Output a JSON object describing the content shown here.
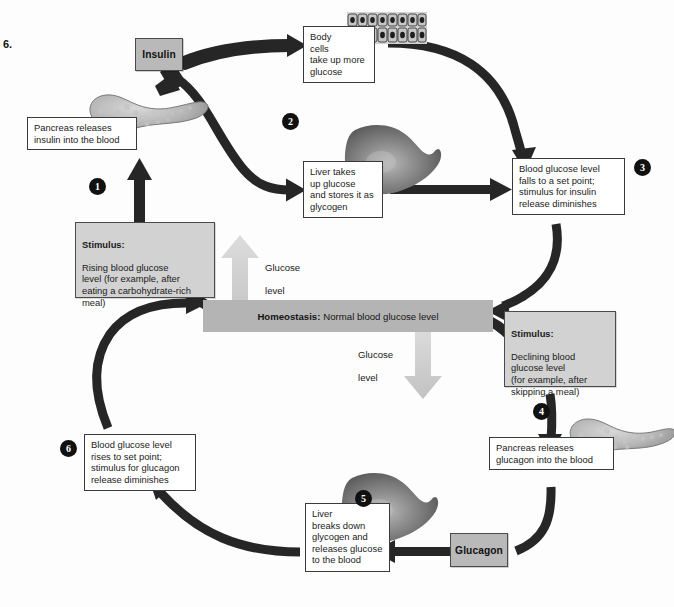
{
  "figure": {
    "label": "6."
  },
  "homeostasis": {
    "bold": "Homeostasis:",
    "text": "Normal blood glucose level"
  },
  "hormones": {
    "insulin": "Insulin",
    "glucagon": "Glucagon"
  },
  "glucose_arrows": [
    {
      "name": "glucose-level-up",
      "line1": "Glucose",
      "line2": "level",
      "direction": "up"
    },
    {
      "name": "glucose-level-down",
      "line1": "Glucose",
      "line2": "level",
      "direction": "down"
    }
  ],
  "steps": [
    {
      "num": "1",
      "name": "step-1"
    },
    {
      "num": "2",
      "name": "step-2"
    },
    {
      "num": "3",
      "name": "step-3"
    },
    {
      "num": "4",
      "name": "step-4"
    },
    {
      "num": "5",
      "name": "step-5"
    },
    {
      "num": "6",
      "name": "step-6"
    }
  ],
  "boxes": {
    "stimulus_rising": {
      "heading": "Stimulus:",
      "body": "Rising blood glucose\nlevel (for example, after\neating a carbohydrate-rich\nmeal)"
    },
    "pancreas_insulin": "Pancreas releases\ninsulin into the blood",
    "body_cells": "Body\ncells\ntake up more\nglucose",
    "liver_stores": "Liver takes\nup glucose\nand stores it as\nglycogen",
    "glucose_falls": "Blood glucose level\nfalls to a set point;\nstimulus for insulin\nrelease diminishes",
    "stimulus_declining": {
      "heading": "Stimulus:",
      "body": "Declining blood\nglucose level\n(for example, after\nskipping a meal)"
    },
    "pancreas_glucagon": "Pancreas releases\nglucagon into the blood",
    "liver_breaks": "Liver\nbreaks down\nglycogen and\nreleases glucose\nto the blood",
    "glucose_rises": "Blood glucose level\nrises to set point;\nstimulus for glucagon\nrelease diminishes"
  },
  "organs": {
    "pancreas_top": "pancreas-illustration",
    "pancreas_bottom": "pancreas-illustration",
    "liver_top": "liver-illustration",
    "liver_bottom": "liver-illustration",
    "body_cells_tissue": "epithelial-tissue-illustration"
  },
  "colors": {
    "arrow": "#262626",
    "homeostasis_bar": "#b4b4b4",
    "hormone_box": "#b9b9b9",
    "stimulus_box": "#d2d2d2",
    "glucose_arrow_up": "#d6d6d6",
    "glucose_arrow_down": "#d0d0d0",
    "box_border": "#3a3a3a",
    "background": "#fdfdfd"
  }
}
